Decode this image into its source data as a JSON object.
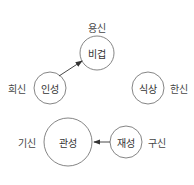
{
  "diagram": {
    "type": "five-element role diagram",
    "nodes": [
      {
        "id": "bigeop",
        "label": "비겁",
        "role": "용신",
        "cx": 97,
        "cy": 53,
        "r": 17
      },
      {
        "id": "inseong",
        "label": "인성",
        "role": "희신",
        "cx": 50,
        "cy": 88,
        "r": 16
      },
      {
        "id": "siksang",
        "label": "식상",
        "role": "한신",
        "cx": 148,
        "cy": 88,
        "r": 16
      },
      {
        "id": "gwanseong",
        "label": "관성",
        "role": "기신",
        "cx": 68,
        "cy": 142,
        "r": 24
      },
      {
        "id": "jaeseong",
        "label": "재성",
        "role": "구신",
        "cx": 126,
        "cy": 142,
        "r": 16
      }
    ],
    "role_labels": [
      {
        "text": "용신",
        "x": 97,
        "y": 27
      },
      {
        "text": "희신",
        "x": 17,
        "y": 88
      },
      {
        "text": "한신",
        "x": 179,
        "y": 88
      },
      {
        "text": "기신",
        "x": 27,
        "y": 142
      },
      {
        "text": "구신",
        "x": 157,
        "y": 142
      }
    ],
    "edges": [
      {
        "from": "인성",
        "to": "비겁"
      },
      {
        "from": "재성",
        "to": "관성"
      }
    ],
    "colors": {
      "stroke": "#555555",
      "arrow": "#333333"
    }
  }
}
